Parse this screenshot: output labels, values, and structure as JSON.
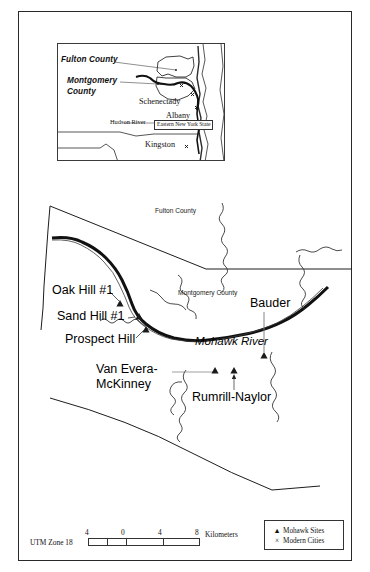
{
  "figure": {
    "type": "map",
    "projection_note": "UTM Zone 18",
    "title_label": "Eastern New York State"
  },
  "inset": {
    "name": "eastern-new-york-state-inset",
    "box_label": "Eastern New York State",
    "labels": [
      {
        "text": "Fulton County",
        "style": "italic"
      },
      {
        "text": "Montgomery",
        "style": "italic"
      },
      {
        "text": "County",
        "style": "italic"
      },
      {
        "text": "Schenectady",
        "style": "plain"
      },
      {
        "text": "Albany",
        "style": "plain"
      },
      {
        "text": "Hudson River",
        "style": "small"
      },
      {
        "text": "Kingston",
        "style": "plain"
      }
    ],
    "cities": [
      "Schenectady",
      "Albany",
      "Kingston"
    ],
    "counties": [
      "Fulton County",
      "Montgomery County"
    ],
    "rivers": [
      "Hudson River"
    ]
  },
  "main_map": {
    "counties": [
      {
        "label": "Fulton County"
      },
      {
        "label": "Montgomery County"
      }
    ],
    "rivers": [
      {
        "label": "Mohawk River"
      }
    ],
    "sites": [
      {
        "label": "Oak Hill #1"
      },
      {
        "label": "Sand Hill #1"
      },
      {
        "label": "Prospect Hill"
      },
      {
        "label": "Van Evera-"
      },
      {
        "label": "McKinney"
      },
      {
        "label": "Rumrill-Naylor"
      },
      {
        "label": "Bauder"
      }
    ]
  },
  "scale": {
    "utm_label": "UTM Zone 18",
    "unit_label": "Kilometers",
    "ticks": [
      "4",
      "0",
      "4",
      "8"
    ]
  },
  "legend": {
    "entries": [
      {
        "symbol": "▲",
        "label": "Mohawk Sites",
        "name": "mohawk-sites"
      },
      {
        "symbol": "×",
        "label": "Modern Cities",
        "name": "modern-cities"
      }
    ]
  }
}
